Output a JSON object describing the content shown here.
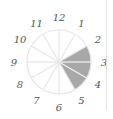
{
  "diagram": {
    "type": "clock-fraction",
    "total_sectors": 12,
    "shaded_from": 2,
    "shaded_to": 5,
    "shaded_count": 3,
    "shade_color": "#a8a8a8",
    "line_color": "#e6e6e6",
    "labels": [
      "12",
      "1",
      "2",
      "3",
      "4",
      "5",
      "6",
      "7",
      "8",
      "9",
      "10",
      "11"
    ]
  }
}
